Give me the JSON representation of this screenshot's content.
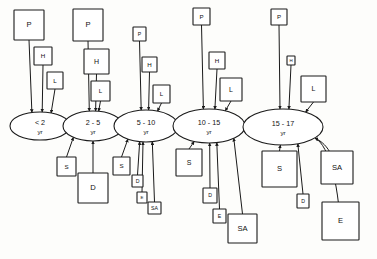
{
  "diagram": {
    "type": "flow-diagram",
    "title": "",
    "width": 377,
    "height": 259,
    "stage_label_suffix": "yr",
    "stages": [
      {
        "id": "stage-lt2",
        "label": "< 2",
        "sub_label": "yr",
        "cx": 40,
        "cy": 126,
        "rx": 30,
        "ry": 14,
        "inputs_above": [
          {
            "code": "P",
            "x": 14,
            "y": 10,
            "w": 30,
            "h": 30
          },
          {
            "code": "H",
            "x": 34,
            "y": 47,
            "w": 18,
            "h": 18
          },
          {
            "code": "L",
            "x": 47,
            "y": 72,
            "w": 16,
            "h": 17
          }
        ],
        "inputs_below": []
      },
      {
        "id": "stage-2-5",
        "label": "2 - 5",
        "sub_label": "yr",
        "cx": 93,
        "cy": 126,
        "rx": 30,
        "ry": 15,
        "inputs_above": [
          {
            "code": "P",
            "x": 73,
            "y": 9,
            "w": 30,
            "h": 32
          },
          {
            "code": "H",
            "x": 84,
            "y": 49,
            "w": 25,
            "h": 25
          },
          {
            "code": "L",
            "x": 91,
            "y": 81,
            "w": 19,
            "h": 20
          }
        ],
        "inputs_below": [
          {
            "code": "S",
            "x": 57,
            "y": 157,
            "w": 19,
            "h": 19
          },
          {
            "code": "D",
            "x": 78,
            "y": 173,
            "w": 30,
            "h": 30
          }
        ]
      },
      {
        "id": "stage-5-10",
        "label": "5 - 10",
        "sub_label": "yr",
        "cx": 146,
        "cy": 126,
        "rx": 32,
        "ry": 16,
        "inputs_above": [
          {
            "code": "P",
            "x": 133,
            "y": 27,
            "w": 13,
            "h": 14
          },
          {
            "code": "H",
            "x": 142,
            "y": 57,
            "w": 15,
            "h": 15
          },
          {
            "code": "L",
            "x": 153,
            "y": 85,
            "w": 17,
            "h": 18
          }
        ],
        "inputs_below": [
          {
            "code": "S",
            "x": 113,
            "y": 157,
            "w": 17,
            "h": 18
          },
          {
            "code": "D",
            "x": 132,
            "y": 175,
            "w": 11,
            "h": 12
          },
          {
            "code": "E",
            "x": 137,
            "y": 192,
            "w": 10,
            "h": 11
          },
          {
            "code": "SA",
            "x": 148,
            "y": 202,
            "w": 13,
            "h": 12
          }
        ]
      },
      {
        "id": "stage-10-15",
        "label": "10 - 15",
        "sub_label": "yr",
        "cx": 209,
        "cy": 126,
        "rx": 36,
        "ry": 17,
        "inputs_above": [
          {
            "code": "P",
            "x": 193,
            "y": 8,
            "w": 17,
            "h": 17
          },
          {
            "code": "H",
            "x": 209,
            "y": 52,
            "w": 16,
            "h": 17
          },
          {
            "code": "L",
            "x": 220,
            "y": 78,
            "w": 22,
            "h": 23
          }
        ],
        "inputs_below": [
          {
            "code": "S",
            "x": 176,
            "y": 149,
            "w": 26,
            "h": 27
          },
          {
            "code": "D",
            "x": 203,
            "y": 188,
            "w": 14,
            "h": 15
          },
          {
            "code": "E",
            "x": 213,
            "y": 209,
            "w": 13,
            "h": 14
          },
          {
            "code": "SA",
            "x": 228,
            "y": 214,
            "w": 29,
            "h": 29
          }
        ]
      },
      {
        "id": "stage-15-17",
        "label": "15 - 17",
        "sub_label": "yr",
        "cx": 283,
        "cy": 127,
        "rx": 40,
        "ry": 18,
        "inputs_above": [
          {
            "code": "P",
            "x": 271,
            "y": 9,
            "w": 16,
            "h": 16
          },
          {
            "code": "H",
            "x": 287,
            "y": 56,
            "w": 8,
            "h": 9
          },
          {
            "code": "L",
            "x": 301,
            "y": 76,
            "w": 25,
            "h": 26
          }
        ],
        "inputs_below": [
          {
            "code": "S",
            "x": 262,
            "y": 151,
            "w": 35,
            "h": 36
          },
          {
            "code": "SA",
            "x": 321,
            "y": 151,
            "w": 32,
            "h": 33
          },
          {
            "code": "D",
            "x": 297,
            "y": 194,
            "w": 12,
            "h": 14
          },
          {
            "code": "E",
            "x": 322,
            "y": 202,
            "w": 37,
            "h": 38
          }
        ]
      }
    ],
    "legend_codes": {
      "P": "P",
      "H": "H",
      "L": "L",
      "S": "S",
      "D": "D",
      "E": "E",
      "SA": "SA"
    },
    "chain_arrows": 4,
    "colors": {
      "stroke": "#1a1a1a",
      "fill": "#ffffff",
      "background": "#fdfdfb",
      "text": "#111111"
    }
  }
}
